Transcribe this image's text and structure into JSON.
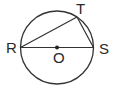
{
  "diagram": {
    "type": "geometry-circle",
    "stroke_color": "#333333",
    "circle": {
      "center_label": "O",
      "cx": 57,
      "cy": 47.5,
      "r": 36.5
    },
    "points": {
      "R": {
        "label": "R",
        "x": 20.5,
        "y": 47.5
      },
      "S": {
        "label": "S",
        "x": 93.5,
        "y": 47.5
      },
      "T": {
        "label": "T",
        "x": 77,
        "y": 17
      },
      "O": {
        "label": "O",
        "x": 57,
        "y": 47.5
      }
    },
    "segments": [
      {
        "from": "R",
        "to": "S",
        "note": "diameter"
      },
      {
        "from": "R",
        "to": "T"
      },
      {
        "from": "T",
        "to": "S"
      }
    ],
    "labels": {
      "R": "R",
      "S": "S",
      "T": "T",
      "O": "O"
    }
  }
}
